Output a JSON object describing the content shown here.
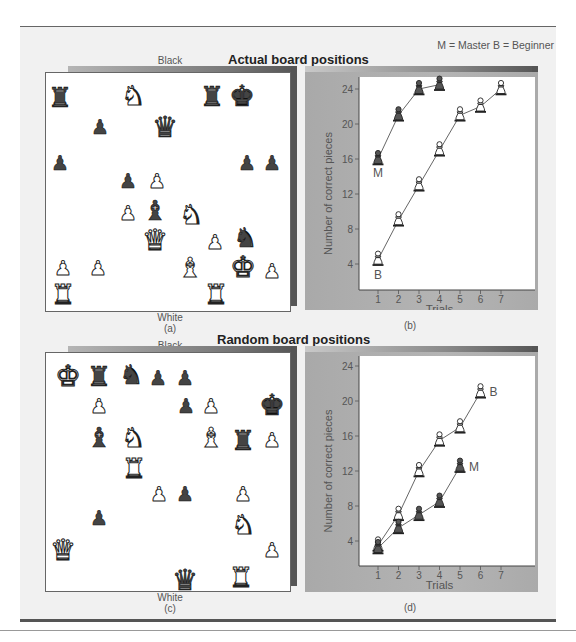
{
  "legend": "M = Master   B = Beginner",
  "sections": {
    "actual": {
      "title": "Actual board positions"
    },
    "random": {
      "title": "Random board positions"
    }
  },
  "boards": {
    "a": {
      "top_label": "Black",
      "bottom_label": "White",
      "caption": "(a)",
      "pieces": [
        {
          "type": "rook",
          "color": "black",
          "x": 60,
          "y": 97
        },
        {
          "type": "knight",
          "color": "white",
          "x": 133,
          "y": 95
        },
        {
          "type": "rook",
          "color": "black",
          "x": 212,
          "y": 96
        },
        {
          "type": "king",
          "color": "black",
          "x": 242,
          "y": 96
        },
        {
          "type": "pawn",
          "color": "black",
          "x": 100,
          "y": 127
        },
        {
          "type": "queen",
          "color": "black",
          "x": 165,
          "y": 127
        },
        {
          "type": "pawn",
          "color": "black",
          "x": 60,
          "y": 163
        },
        {
          "type": "pawn",
          "color": "black",
          "x": 247,
          "y": 163
        },
        {
          "type": "pawn",
          "color": "black",
          "x": 272,
          "y": 163
        },
        {
          "type": "pawn",
          "color": "black",
          "x": 128,
          "y": 181
        },
        {
          "type": "pawn",
          "color": "white",
          "x": 157,
          "y": 181
        },
        {
          "type": "pawn",
          "color": "white",
          "x": 128,
          "y": 213
        },
        {
          "type": "bishop",
          "color": "black",
          "x": 155,
          "y": 210
        },
        {
          "type": "knight",
          "color": "white",
          "x": 191,
          "y": 214
        },
        {
          "type": "queen",
          "color": "white",
          "x": 155,
          "y": 240
        },
        {
          "type": "pawn",
          "color": "white",
          "x": 215,
          "y": 242
        },
        {
          "type": "knight",
          "color": "black",
          "x": 245,
          "y": 237
        },
        {
          "type": "pawn",
          "color": "white",
          "x": 63,
          "y": 268
        },
        {
          "type": "pawn",
          "color": "white",
          "x": 98,
          "y": 268
        },
        {
          "type": "bishop",
          "color": "white",
          "x": 190,
          "y": 267
        },
        {
          "type": "king",
          "color": "white",
          "x": 243,
          "y": 267
        },
        {
          "type": "pawn",
          "color": "white",
          "x": 272,
          "y": 271
        },
        {
          "type": "rook",
          "color": "white",
          "x": 63,
          "y": 294
        },
        {
          "type": "rook",
          "color": "white",
          "x": 216,
          "y": 294
        }
      ]
    },
    "c": {
      "top_label": "Black",
      "bottom_label": "White",
      "caption": "(c)",
      "pieces": [
        {
          "type": "king",
          "color": "white",
          "x": 68,
          "y": 376
        },
        {
          "type": "rook",
          "color": "black",
          "x": 99,
          "y": 376
        },
        {
          "type": "knight",
          "color": "black",
          "x": 131,
          "y": 374
        },
        {
          "type": "pawn",
          "color": "black",
          "x": 158,
          "y": 378
        },
        {
          "type": "pawn",
          "color": "black",
          "x": 185,
          "y": 378
        },
        {
          "type": "pawn",
          "color": "white",
          "x": 99,
          "y": 406
        },
        {
          "type": "pawn",
          "color": "black",
          "x": 186,
          "y": 406
        },
        {
          "type": "pawn",
          "color": "white",
          "x": 211,
          "y": 406
        },
        {
          "type": "king",
          "color": "black",
          "x": 272,
          "y": 405
        },
        {
          "type": "bishop",
          "color": "black",
          "x": 99,
          "y": 437
        },
        {
          "type": "knight",
          "color": "white",
          "x": 133,
          "y": 437
        },
        {
          "type": "bishop",
          "color": "white",
          "x": 211,
          "y": 437
        },
        {
          "type": "rook",
          "color": "black",
          "x": 243,
          "y": 440
        },
        {
          "type": "pawn",
          "color": "white",
          "x": 272,
          "y": 440
        },
        {
          "type": "rook",
          "color": "white",
          "x": 134,
          "y": 468
        },
        {
          "type": "pawn",
          "color": "white",
          "x": 159,
          "y": 494
        },
        {
          "type": "pawn",
          "color": "black",
          "x": 185,
          "y": 494
        },
        {
          "type": "pawn",
          "color": "white",
          "x": 243,
          "y": 494
        },
        {
          "type": "pawn",
          "color": "black",
          "x": 99,
          "y": 518
        },
        {
          "type": "knight",
          "color": "white",
          "x": 243,
          "y": 524
        },
        {
          "type": "queen",
          "color": "white",
          "x": 63,
          "y": 550
        },
        {
          "type": "pawn",
          "color": "white",
          "x": 272,
          "y": 550
        },
        {
          "type": "queen",
          "color": "black",
          "x": 185,
          "y": 580
        },
        {
          "type": "rook",
          "color": "white",
          "x": 241,
          "y": 577
        }
      ]
    }
  },
  "chart_data": [
    {
      "id": "b",
      "type": "line",
      "caption": "(b)",
      "title": "Actual board positions",
      "xlabel": "Trials",
      "ylabel": "Number of correct pieces",
      "x_ticks": [
        1,
        2,
        3,
        4,
        5,
        6,
        7
      ],
      "y_ticks": [
        4,
        8,
        12,
        16,
        20,
        24
      ],
      "xlim": [
        0.5,
        7.5
      ],
      "ylim": [
        1,
        25
      ],
      "grid": false,
      "series": [
        {
          "name": "M",
          "label": "M",
          "marker": "black-pawn",
          "x": [
            1,
            2,
            3,
            4
          ],
          "values": [
            16,
            21,
            24,
            24.5
          ]
        },
        {
          "name": "B",
          "label": "B",
          "marker": "white-pawn",
          "x": [
            1,
            2,
            3,
            4,
            5,
            6,
            7
          ],
          "values": [
            4.5,
            9,
            13,
            17,
            21,
            22,
            24
          ]
        }
      ]
    },
    {
      "id": "d",
      "type": "line",
      "caption": "(d)",
      "title": "Random board positions",
      "xlabel": "Trials",
      "ylabel": "Number of correct pieces",
      "x_ticks": [
        1,
        2,
        3,
        4,
        5,
        6,
        7
      ],
      "y_ticks": [
        4,
        8,
        12,
        16,
        20,
        24
      ],
      "xlim": [
        0.5,
        7.5
      ],
      "ylim": [
        1,
        25
      ],
      "grid": false,
      "series": [
        {
          "name": "B",
          "label": "B",
          "marker": "white-pawn",
          "x": [
            1,
            2,
            3,
            4,
            5,
            6
          ],
          "values": [
            3.5,
            7,
            12,
            15.5,
            17,
            21
          ]
        },
        {
          "name": "M",
          "label": "M",
          "marker": "black-pawn",
          "x": [
            1,
            2,
            3,
            4,
            5
          ],
          "values": [
            3.2,
            5.5,
            7,
            8.5,
            12.5
          ]
        }
      ]
    }
  ],
  "glyphs": {
    "king": "♚",
    "queen": "♛",
    "rook": "♜",
    "bishop": "♝",
    "knight": "♞",
    "pawn": "♟"
  }
}
